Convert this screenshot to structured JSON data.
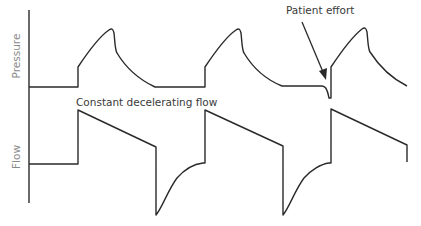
{
  "diagram": {
    "labels": {
      "pressure_axis": "Pressure",
      "flow_axis": "Flow"
    },
    "annotations": {
      "flow_pattern": "Constant decelerating flow",
      "patient_effort": "Patient effort"
    },
    "colors": {
      "line": "#2a2a2a",
      "axis_label": "#8a8a8a",
      "annotation": "#3a3a3a"
    },
    "waveforms": {
      "pressure": "Three pressure-control breaths; third breath is triggered by patient effort (negative dip before rise)",
      "flow": "Square rise then linear decelerating inspiratory flow; exponential expiratory return to baseline"
    }
  }
}
